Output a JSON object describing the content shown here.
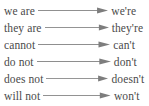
{
  "figure": {
    "name": "contractions-list",
    "background_color": "#ffffff",
    "text_color": "#4a4a4a",
    "arrow_color": "#6e6e6e",
    "arrow_glyph": "right-arrow",
    "rows": [
      {
        "source": "we are",
        "target": "we're",
        "arrow": "→"
      },
      {
        "source": "they are",
        "target": "they're",
        "arrow": "→"
      },
      {
        "source": "cannot",
        "target": "can't",
        "arrow": "→"
      },
      {
        "source": "do not",
        "target": "don't",
        "arrow": "→"
      },
      {
        "source": "does not",
        "target": "doesn't",
        "arrow": "→"
      },
      {
        "source": "will not",
        "target": "won't",
        "arrow": "→"
      }
    ]
  }
}
